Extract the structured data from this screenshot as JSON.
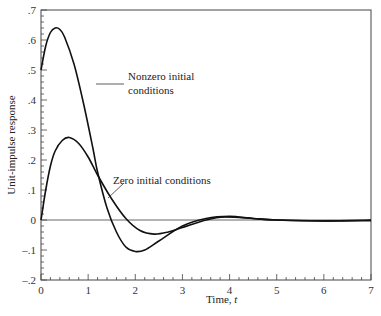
{
  "chart_data": {
    "type": "line",
    "title": "",
    "xlabel": "Time, t",
    "ylabel": "Unit-impulse response",
    "xlim": [
      0,
      7
    ],
    "ylim": [
      -0.2,
      0.7
    ],
    "grid": false,
    "xticks": [
      "0",
      "1",
      "2",
      "3",
      "4",
      "5",
      "6",
      "7"
    ],
    "yticks": [
      "-.2",
      "-.1",
      "0",
      ".1",
      ".2",
      ".3",
      ".4",
      ".5",
      ".6",
      ".7"
    ],
    "annotations": [
      {
        "text": "Nonzero initial",
        "text2": "conditions"
      },
      {
        "text": "Zero initial conditions"
      }
    ],
    "series": [
      {
        "name": "Nonzero initial conditions",
        "x": [
          0,
          0.1,
          0.2,
          0.3,
          0.4,
          0.5,
          0.7,
          0.9,
          1.1,
          1.2,
          1.4,
          1.6,
          1.8,
          2.0,
          2.2,
          2.5,
          3.0,
          3.5,
          4.0,
          4.5,
          5.0,
          6.0,
          7.0
        ],
        "y": [
          0.5,
          0.58,
          0.625,
          0.64,
          0.635,
          0.61,
          0.52,
          0.39,
          0.24,
          0.16,
          0.04,
          -0.04,
          -0.09,
          -0.105,
          -0.1,
          -0.07,
          -0.02,
          0.005,
          0.012,
          0.005,
          0.0,
          -0.003,
          0.0
        ]
      },
      {
        "name": "Zero initial conditions",
        "x": [
          0,
          0.1,
          0.2,
          0.3,
          0.45,
          0.6,
          0.8,
          1.0,
          1.2,
          1.5,
          1.8,
          2.1,
          2.4,
          2.7,
          3.0,
          3.5,
          3.9,
          4.5,
          5.0,
          6.0,
          7.0
        ],
        "y": [
          0,
          0.1,
          0.18,
          0.23,
          0.265,
          0.275,
          0.255,
          0.21,
          0.15,
          0.07,
          0.005,
          -0.035,
          -0.047,
          -0.04,
          -0.025,
          0.0,
          0.01,
          0.005,
          0.0,
          -0.003,
          -0.002
        ]
      }
    ]
  }
}
